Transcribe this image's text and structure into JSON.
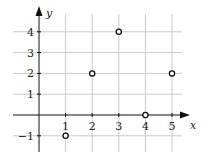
{
  "chart_data": {
    "type": "scatter",
    "title": "",
    "xlabel": "x",
    "ylabel": "y",
    "x_ticks": [
      "1",
      "2",
      "3",
      "4",
      "5"
    ],
    "y_ticks": [
      "-1",
      "1",
      "2",
      "3",
      "4"
    ],
    "xlim": [
      -0.6,
      5.8
    ],
    "ylim": [
      -1.8,
      4.8
    ],
    "grid": true,
    "marker": "open-circle",
    "points": [
      {
        "x": 1,
        "y": -1
      },
      {
        "x": 2,
        "y": 2
      },
      {
        "x": 3,
        "y": 4
      },
      {
        "x": 4,
        "y": 0
      },
      {
        "x": 5,
        "y": 2
      }
    ],
    "colors": {
      "axis": "#111111",
      "grid": "#c8c8c8",
      "marker": "#111111"
    }
  }
}
